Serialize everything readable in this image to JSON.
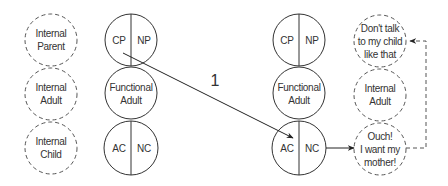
{
  "left_internal": {
    "parent": [
      "Internal",
      "Parent"
    ],
    "adult": [
      "Internal",
      "Adult"
    ],
    "child": [
      "Internal",
      "Child"
    ]
  },
  "left_functional": {
    "parent_left": "CP",
    "parent_right": "NP",
    "adult": [
      "Functional",
      "Adult"
    ],
    "child_left": "AC",
    "child_right": "NC"
  },
  "transaction_label": "1",
  "right_functional": {
    "parent_left": "CP",
    "parent_right": "NP",
    "adult": [
      "Functional",
      "Adult"
    ],
    "child_left": "AC",
    "child_right": "NC"
  },
  "right_internal": {
    "parent": [
      "Don't talk",
      "to my child",
      "like that"
    ],
    "adult": [
      "Internal",
      "Adult"
    ],
    "child": [
      "Ouch!",
      "I want my",
      "mother!"
    ]
  },
  "colors": {
    "stroke": "#333333",
    "dashed_stroke": "#555555",
    "background": "#ffffff"
  }
}
